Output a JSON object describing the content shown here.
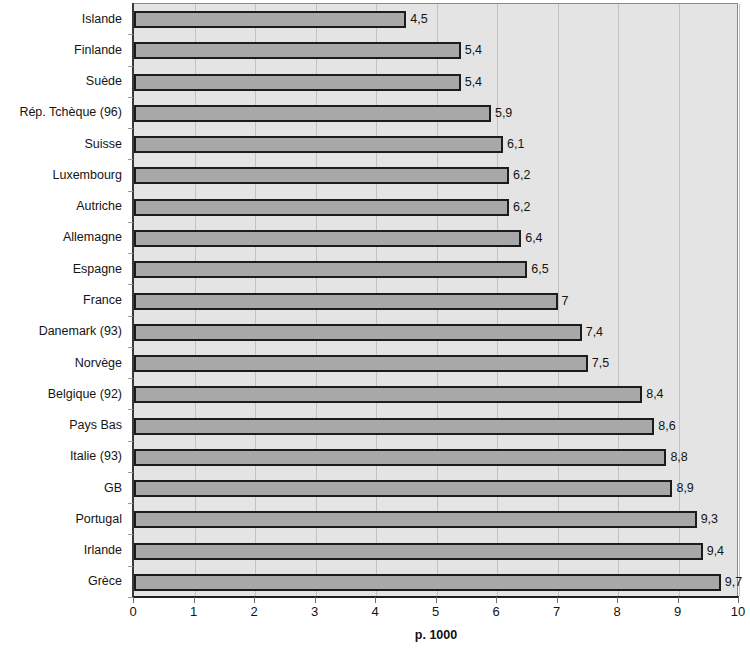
{
  "chart_data": {
    "type": "bar",
    "orientation": "horizontal",
    "title": "",
    "xlabel": "p. 1000",
    "ylabel": "",
    "xlim": [
      0,
      10
    ],
    "xticks": [
      "0",
      "1",
      "2",
      "3",
      "4",
      "5",
      "6",
      "7",
      "8",
      "9",
      "10"
    ],
    "grid": true,
    "legend": false,
    "categories": [
      "Islande",
      "Finlande",
      "Suède",
      "Rép. Tchèque (96)",
      "Suisse",
      "Luxembourg",
      "Autriche",
      "Allemagne",
      "Espagne",
      "France",
      "Danemark (93)",
      "Norvège",
      "Belgique (92)",
      "Pays Bas",
      "Italie (93)",
      "GB",
      "Portugal",
      "Irlande",
      "Grèce"
    ],
    "values": [
      4.5,
      5.4,
      5.4,
      5.9,
      6.1,
      6.2,
      6.2,
      6.4,
      6.5,
      7,
      7.4,
      7.5,
      8.4,
      8.6,
      8.8,
      8.9,
      9.3,
      9.4,
      9.7
    ],
    "value_labels": [
      "4,5",
      "5,4",
      "5,4",
      "5,9",
      "6,1",
      "6,2",
      "6,2",
      "6,4",
      "6,5",
      "7",
      "7,4",
      "7,5",
      "8,4",
      "8,6",
      "8,8",
      "8,9",
      "9,3",
      "9,4",
      "9,7"
    ],
    "colors": {
      "bar_fill": "#a8a8a8",
      "bar_edge": "#1c1c1c",
      "plot_background": "#e4e4e4",
      "gridline": "#c2c2c2",
      "text": "#141414"
    }
  }
}
